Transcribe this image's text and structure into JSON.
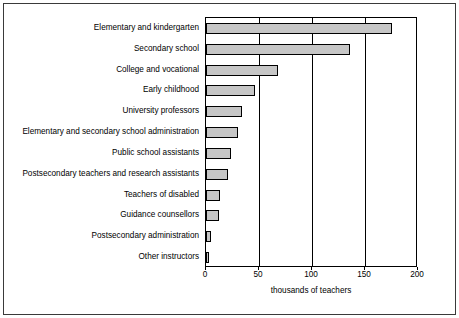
{
  "chart_data": {
    "type": "bar",
    "orientation": "horizontal",
    "title": "",
    "xlabel": "thousands of teachers",
    "ylabel": "",
    "xlim": [
      0,
      200
    ],
    "xticks": [
      0,
      50,
      100,
      150,
      200
    ],
    "xtick_labels": [
      "0",
      "50",
      "100",
      "150",
      "200"
    ],
    "grid": true,
    "legend": false,
    "bar_color": "#c6c6c6",
    "bar_edge_color": "#000000",
    "categories": [
      "Elementary and kindergarten",
      "Secondary school",
      "College and vocational",
      "Early childhood",
      "University professors",
      "Elementary and secondary school administration",
      "Public school assistants",
      "Postsecondary teachers and research assistants",
      "Teachers of disabled",
      "Guidance counsellors",
      "Postsecondary administration",
      "Other instructors"
    ],
    "values": [
      175,
      136,
      68,
      46,
      34,
      30,
      24,
      21,
      13,
      12,
      5,
      3
    ]
  }
}
